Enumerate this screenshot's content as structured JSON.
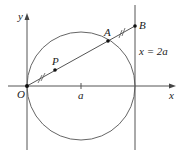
{
  "diagram": {
    "axes": {
      "x_label": "x",
      "y_label": "y",
      "origin_label": "O"
    },
    "tick_label": "a",
    "points": {
      "P": "P",
      "A": "A",
      "B": "B"
    },
    "line_label": "x = 2a",
    "colors": {
      "stroke": "#555555",
      "text": "#222222"
    }
  }
}
